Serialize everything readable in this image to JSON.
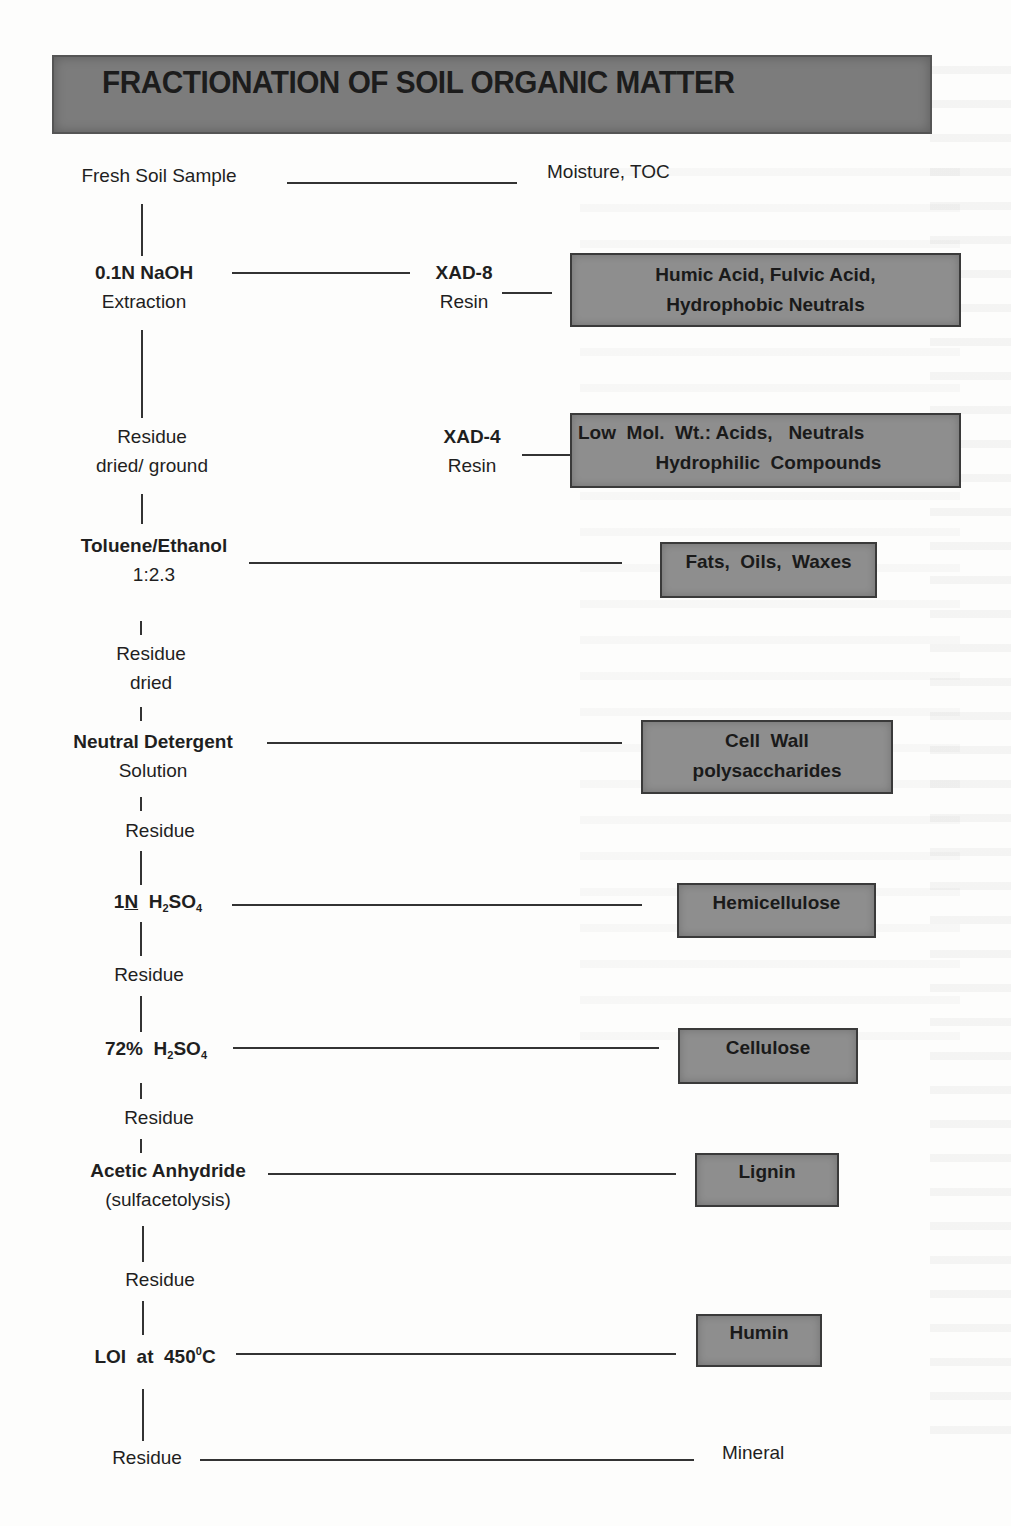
{
  "title": "FRACTIONATION OF SOIL ORGANIC MATTER",
  "colors": {
    "title_bar": "#7c7c7c",
    "fraction_box": "#8e8e8e",
    "line": "#333333",
    "background": "#fdfdfc"
  },
  "steps": [
    {
      "id": "fresh",
      "line1": "Fresh Soil Sample",
      "line2": ""
    },
    {
      "id": "naoh",
      "line1": "0.1N  NaOH",
      "line2": "Extraction"
    },
    {
      "id": "residue1",
      "line1": "Residue",
      "line2": "dried/ ground"
    },
    {
      "id": "toluene",
      "line1": "Toluene/Ethanol",
      "line2": "1:2.3"
    },
    {
      "id": "residue2",
      "line1": "Residue",
      "line2": "dried"
    },
    {
      "id": "detergent",
      "line1": "Neutral Detergent",
      "line2": "Solution"
    },
    {
      "id": "residue3",
      "line1": "Residue",
      "line2": ""
    },
    {
      "id": "h2so4_1n",
      "prefix": "1",
      "prefix_underlined": "N",
      "reagent": "H",
      "sub1": "2",
      "mid": "SO",
      "sub2": "4"
    },
    {
      "id": "residue4",
      "line1": "Residue",
      "line2": ""
    },
    {
      "id": "h2so4_72",
      "prefix": "72%  ",
      "reagent": "H",
      "sub1": "2",
      "mid": "SO",
      "sub2": "4"
    },
    {
      "id": "residue5",
      "line1": "Residue",
      "line2": ""
    },
    {
      "id": "acetic",
      "line1": "Acetic Anhydride",
      "line2": "(sulfacetolysis)"
    },
    {
      "id": "residue6",
      "line1": "Residue",
      "line2": ""
    },
    {
      "id": "loi",
      "text": "LOI  at  450",
      "sup": "0",
      "suffix": "C"
    },
    {
      "id": "residue7",
      "line1": "Residue",
      "line2": ""
    }
  ],
  "resins": [
    {
      "id": "xad8",
      "line1": "XAD-8",
      "line2": "Resin"
    },
    {
      "id": "xad4",
      "line1": "XAD-4",
      "line2": "Resin"
    }
  ],
  "outputs_plain": [
    {
      "id": "moisture",
      "text": "Moisture, TOC"
    },
    {
      "id": "mineral",
      "text": "Mineral"
    }
  ],
  "fractions": [
    {
      "id": "humic",
      "line1": "Humic Acid, Fulvic Acid,",
      "line2": "Hydrophobic Neutrals"
    },
    {
      "id": "lowmol",
      "line1": "Low  Mol.  Wt.: Acids,   Neutrals",
      "line2": "Hydrophilic  Compounds"
    },
    {
      "id": "fats",
      "line1": "Fats,  Oils,  Waxes",
      "line2": ""
    },
    {
      "id": "cellwall",
      "line1": "Cell  Wall",
      "line2": "polysaccharides"
    },
    {
      "id": "hemi",
      "line1": "Hemicellulose",
      "line2": ""
    },
    {
      "id": "cellulose",
      "line1": "Cellulose",
      "line2": ""
    },
    {
      "id": "lignin",
      "line1": "Lignin",
      "line2": ""
    },
    {
      "id": "humin",
      "line1": "Humin",
      "line2": ""
    }
  ]
}
